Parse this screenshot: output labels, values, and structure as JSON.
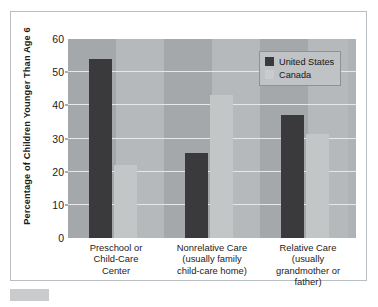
{
  "chart_data": {
    "type": "bar",
    "title": "",
    "subtitle": "",
    "xlabel": "",
    "ylabel": "Percentage of Children Younger Than Age 6",
    "ylim": [
      0,
      60
    ],
    "yticks": [
      0,
      10,
      20,
      30,
      40,
      50,
      60
    ],
    "grid": true,
    "legend_position": "top-right",
    "categories": [
      "Preschool or\nChild-Care\nCenter",
      "Nonrelative Care\n(usually family\nchild-care home)",
      "Relative Care\n(usually\ngrandmother or\nfather)"
    ],
    "category_lines": [
      [
        "Preschool or",
        "Child-Care",
        "Center"
      ],
      [
        "Nonrelative Care",
        "(usually family",
        "child-care home)"
      ],
      [
        "Relative Care",
        "(usually",
        "grandmother or",
        "father)"
      ]
    ],
    "series": [
      {
        "name": "United States",
        "color": "#3a3a3c",
        "values": [
          54,
          25.5,
          37
        ]
      },
      {
        "name": "Canada",
        "color": "#c3c6c7",
        "values": [
          22,
          43,
          31.5
        ]
      }
    ]
  },
  "legend": {
    "items": [
      {
        "label": "United States",
        "key": "us"
      },
      {
        "label": "Canada",
        "key": "ca"
      }
    ]
  },
  "colors": {
    "plot_background": "#a5a8ab",
    "plot_band": "#b6b9bb",
    "gridline": "#e6e8e9",
    "frame_border": "#b9bdc4",
    "us_bar": "#3a3a3c",
    "ca_bar": "#c3c6c7",
    "legend_background": "#c0c3c5",
    "text": "#1b1b1b"
  }
}
